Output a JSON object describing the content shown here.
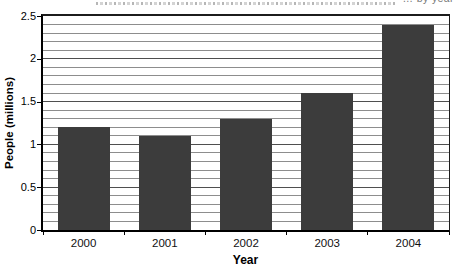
{
  "header": {
    "clipped_title_fragment": "… by year"
  },
  "chart_data": {
    "type": "bar",
    "title": "",
    "categories": [
      "2000",
      "2001",
      "2002",
      "2003",
      "2004"
    ],
    "values": [
      1.2,
      1.1,
      1.3,
      1.6,
      2.4
    ],
    "xlabel": "Year",
    "ylabel": "People (millions)",
    "ylim": [
      0,
      2.5
    ],
    "y_major_step": 0.5,
    "y_minor_step": 0.1,
    "y_tick_labels": [
      "0",
      "0.5",
      "1",
      "1.5",
      "2",
      "2.5"
    ],
    "grid": "horizontal minor gridlines every 0.1",
    "legend": "none",
    "colors": {
      "bar": "#3c3c3c",
      "gridline_minor": "#8d8d8d",
      "gridline_major": "#4f4f4f",
      "axis": "#000000",
      "background": "#ffffff",
      "clipped_title_text": "#777777"
    }
  }
}
